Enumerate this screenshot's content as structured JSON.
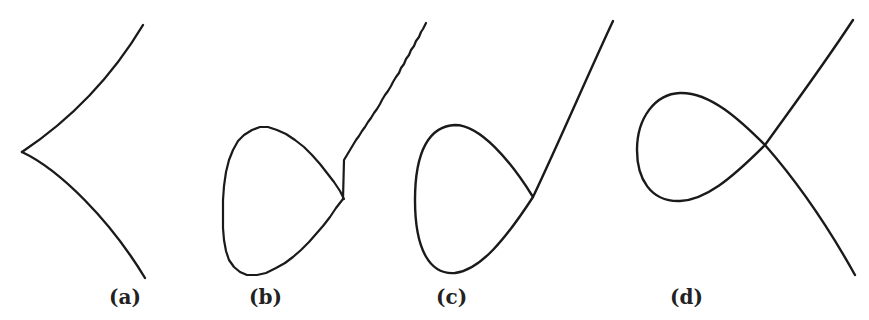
{
  "figure": {
    "panels": [
      {
        "id": "a",
        "label": "(a)",
        "description": "cusp"
      },
      {
        "id": "b",
        "label": "(b)",
        "description": "loop with jagged (pixelated) rendering"
      },
      {
        "id": "c",
        "label": "(c)",
        "description": "loop with smooth rendering"
      },
      {
        "id": "d",
        "label": "(d)",
        "description": "node / self-intersecting loop"
      }
    ],
    "colors": {
      "stroke": "#1a1a1a",
      "label": "#222222",
      "background": "#ffffff"
    }
  }
}
